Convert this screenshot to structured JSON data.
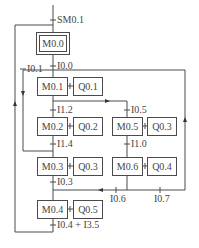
{
  "diagram": {
    "type": "SFC sequential function chart",
    "initial_condition": "SM0.1",
    "steps": [
      {
        "id": "M0.0",
        "initial": true
      },
      {
        "id": "M0.1",
        "action": "Q0.1"
      },
      {
        "id": "M0.2",
        "action": "Q0.2"
      },
      {
        "id": "M0.3",
        "action": "Q0.3"
      },
      {
        "id": "M0.4",
        "action": "Q0.5"
      },
      {
        "id": "M0.5",
        "action": "Q0.3"
      },
      {
        "id": "M0.6",
        "action": "Q0.4"
      }
    ],
    "transitions": {
      "t_init": "SM0.1",
      "t_m0_m1": "I0.0",
      "t_m2_m1": "I0.1",
      "t_m1_m2": "I1.2",
      "t_m1_m5": "I0.5",
      "t_m2_m3": "I1.4",
      "t_m5_m6": "I1.0",
      "t_m3_m4": "I0.3",
      "t_m6_m4": "I0.6",
      "t_m6_right": "I0.7",
      "t_m4_m0_a": "I0.4 + ",
      "t_m4_m0_b": "I3.5"
    }
  }
}
